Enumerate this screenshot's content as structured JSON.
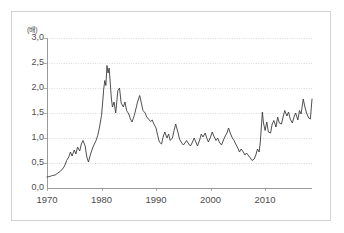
{
  "chart_data": {
    "type": "line",
    "title": "",
    "subtitle": "",
    "unit_label": "(배)",
    "xlabel": "",
    "ylabel": "",
    "xlim": [
      1970,
      2018.6
    ],
    "ylim": [
      0.0,
      3.0
    ],
    "grid": true,
    "legend": null,
    "x_ticks": [
      {
        "value": 1970,
        "label": "1970"
      },
      {
        "value": 1980,
        "label": "1980"
      },
      {
        "value": 1990,
        "label": "1990"
      },
      {
        "value": 2000,
        "label": "2000"
      },
      {
        "value": 2010,
        "label": "2010"
      }
    ],
    "y_ticks": [
      {
        "value": 3.0,
        "label": "3,0"
      },
      {
        "value": 2.5,
        "label": "2,5"
      },
      {
        "value": 2.0,
        "label": "2,0"
      },
      {
        "value": 1.5,
        "label": "1,5"
      },
      {
        "value": 1.0,
        "label": "1,0"
      },
      {
        "value": 0.5,
        "label": "0,5"
      },
      {
        "value": 0.0,
        "label": "0,0"
      }
    ],
    "line_color": "#3c3c3c",
    "grid_color": "#c8c8c8",
    "axis_color": "#9a9a9a",
    "series": [
      {
        "name": "series-1",
        "x": [
          1970.0,
          1970.5,
          1971.0,
          1971.5,
          1972.0,
          1972.5,
          1973.0,
          1973.3,
          1973.6,
          1974.0,
          1974.3,
          1974.6,
          1975.0,
          1975.3,
          1975.6,
          1976.0,
          1976.3,
          1976.6,
          1977.0,
          1977.3,
          1977.6,
          1978.0,
          1978.3,
          1978.6,
          1979.0,
          1979.3,
          1979.6,
          1980.0,
          1980.2,
          1980.4,
          1980.6,
          1980.8,
          1981.0,
          1981.2,
          1981.4,
          1981.6,
          1981.8,
          1982.0,
          1982.3,
          1982.6,
          1983.0,
          1983.3,
          1983.6,
          1984.0,
          1984.3,
          1984.6,
          1985.0,
          1985.3,
          1985.6,
          1986.0,
          1986.3,
          1986.6,
          1987.0,
          1987.3,
          1987.6,
          1988.0,
          1988.3,
          1988.6,
          1989.0,
          1989.3,
          1989.6,
          1990.0,
          1990.3,
          1990.6,
          1991.0,
          1991.3,
          1991.6,
          1992.0,
          1992.3,
          1992.6,
          1993.0,
          1993.3,
          1993.6,
          1994.0,
          1994.3,
          1994.6,
          1995.0,
          1995.3,
          1995.6,
          1996.0,
          1996.3,
          1996.6,
          1997.0,
          1997.3,
          1997.6,
          1998.0,
          1998.3,
          1998.6,
          1999.0,
          1999.3,
          1999.6,
          2000.0,
          2000.3,
          2000.6,
          2001.0,
          2001.3,
          2001.6,
          2002.0,
          2002.3,
          2002.6,
          2003.0,
          2003.3,
          2003.6,
          2004.0,
          2004.3,
          2004.6,
          2005.0,
          2005.3,
          2005.6,
          2006.0,
          2006.3,
          2006.6,
          2007.0,
          2007.3,
          2007.6,
          2008.0,
          2008.3,
          2008.6,
          2008.9,
          2009.1,
          2009.3,
          2009.5,
          2009.7,
          2010.0,
          2010.3,
          2010.6,
          2011.0,
          2011.3,
          2011.6,
          2012.0,
          2012.3,
          2012.6,
          2013.0,
          2013.3,
          2013.6,
          2014.0,
          2014.3,
          2014.6,
          2015.0,
          2015.3,
          2015.6,
          2016.0,
          2016.3,
          2016.6,
          2017.0,
          2017.3,
          2017.6,
          2018.0,
          2018.3,
          2018.6
        ],
        "y": [
          0.22,
          0.23,
          0.25,
          0.26,
          0.3,
          0.34,
          0.4,
          0.46,
          0.55,
          0.62,
          0.72,
          0.64,
          0.76,
          0.68,
          0.82,
          0.74,
          0.88,
          0.95,
          0.84,
          0.62,
          0.52,
          0.68,
          0.78,
          0.86,
          0.95,
          1.05,
          1.2,
          1.45,
          1.7,
          1.98,
          2.15,
          2.05,
          2.45,
          2.3,
          2.4,
          2.1,
          1.8,
          1.62,
          1.72,
          1.5,
          1.95,
          2.0,
          1.7,
          1.62,
          1.72,
          1.55,
          1.48,
          1.38,
          1.32,
          1.45,
          1.58,
          1.72,
          1.85,
          1.7,
          1.55,
          1.5,
          1.42,
          1.38,
          1.33,
          1.36,
          1.28,
          1.2,
          1.05,
          0.92,
          0.88,
          1.02,
          1.12,
          1.0,
          1.08,
          0.95,
          1.0,
          1.15,
          1.28,
          1.12,
          0.98,
          0.92,
          0.86,
          0.9,
          0.95,
          0.88,
          0.84,
          0.9,
          1.0,
          0.92,
          0.84,
          0.96,
          1.08,
          1.02,
          1.1,
          1.0,
          0.92,
          1.02,
          1.12,
          1.04,
          0.95,
          1.0,
          0.92,
          0.86,
          0.94,
          1.02,
          1.1,
          1.2,
          1.1,
          1.0,
          0.95,
          0.88,
          0.8,
          0.72,
          0.78,
          0.72,
          0.66,
          0.7,
          0.64,
          0.6,
          0.55,
          0.58,
          0.66,
          0.78,
          0.72,
          0.9,
          1.2,
          1.52,
          1.3,
          1.15,
          1.32,
          1.12,
          1.1,
          1.28,
          1.35,
          1.22,
          1.42,
          1.3,
          1.28,
          1.42,
          1.55,
          1.44,
          1.52,
          1.38,
          1.3,
          1.42,
          1.5,
          1.36,
          1.55,
          1.48,
          1.78,
          1.62,
          1.5,
          1.4,
          1.38,
          1.78
        ]
      }
    ]
  },
  "figure": {
    "unit_label": "(배)"
  }
}
